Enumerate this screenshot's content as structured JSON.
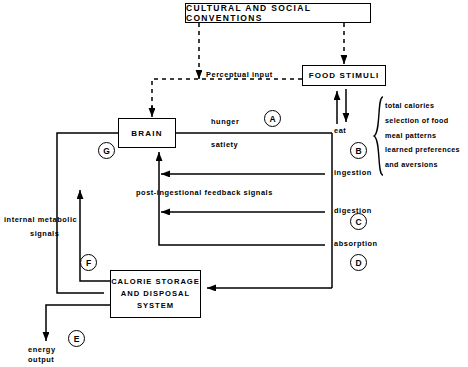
{
  "diagram": {
    "title_box": "CULTURAL AND SOCIAL CONVENTIONS",
    "nodes": {
      "cultural": "CULTURAL AND SOCIAL CONVENTIONS",
      "food_stimuli": "FOOD STIMULI",
      "brain": "BRAIN",
      "calorie_line1": "CALORIE STORAGE",
      "calorie_line2": "AND DISPOSAL",
      "calorie_line3": "SYSTEM"
    },
    "labels": {
      "perceptual_input": "Perceptual input",
      "hunger": "hunger",
      "satiety": "satiety",
      "eat": "eat",
      "ingestion": "ingestion",
      "digestion": "digestion",
      "absorption": "absorption",
      "post_ingestional": "post-ingestional feedback signals",
      "internal_metabolic_l1": "internal metabolic",
      "internal_metabolic_l2": "signals",
      "energy_l1": "energy",
      "energy_l2": "output"
    },
    "factor_list": [
      "total calories",
      "selection of food",
      "meal patterns",
      "learned preferences",
      "and aversions"
    ],
    "markers": {
      "a": "A",
      "b": "B",
      "c": "C",
      "d": "D",
      "e": "E",
      "f": "F",
      "g": "G"
    },
    "colors": {
      "stroke": "#000000",
      "background": "#ffffff"
    }
  }
}
